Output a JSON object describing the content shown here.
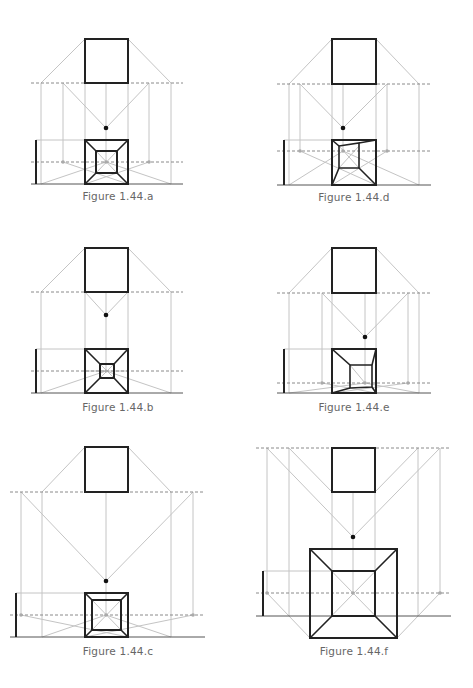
{
  "figures": [
    {
      "id": "a",
      "caption": "Figure 1.44.a"
    },
    {
      "id": "d",
      "caption": "Figure 1.44.d"
    },
    {
      "id": "b",
      "caption": "Figure 1.44.b"
    },
    {
      "id": "e",
      "caption": "Figure 1.44.e"
    },
    {
      "id": "c",
      "caption": "Figure 1.44.c"
    },
    {
      "id": "f",
      "caption": "Figure 1.44.f"
    }
  ],
  "colors": {
    "construction": "#c4c4c4",
    "outline": "#222222",
    "caption": "#666666",
    "horizon_dash": "#8a8a8a"
  }
}
